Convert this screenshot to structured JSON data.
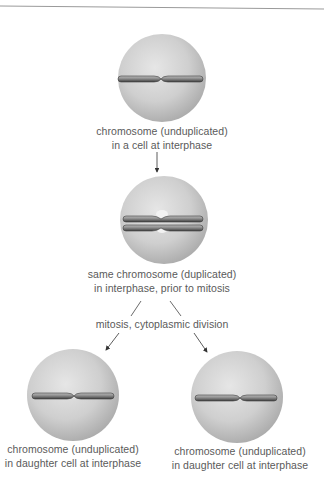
{
  "cells": [
    {
      "id": "cell-interphase",
      "chromosome": "unduplicated",
      "label_lines": [
        "chromosome (unduplicated)",
        "in a cell at interphase"
      ]
    },
    {
      "id": "cell-duplicated",
      "chromosome": "duplicated",
      "label_lines": [
        "same chromosome (duplicated)",
        "in interphase, prior to mitosis"
      ]
    },
    {
      "id": "cell-daughter-left",
      "chromosome": "unduplicated",
      "label_lines": [
        "chromosome (unduplicated)",
        "in daughter cell at interphase"
      ]
    },
    {
      "id": "cell-daughter-right",
      "chromosome": "unduplicated",
      "label_lines": [
        "chromosome (unduplicated)",
        "in daughter cell at interphase"
      ]
    }
  ],
  "process_label": "mitosis, cytoplasmic division",
  "colors": {
    "cell_light": "#e4e4e4",
    "cell_dark": "#a9a9a9",
    "chromosome": "#8a8a8a",
    "chromosome_edge": "#3c3c3c",
    "arrow": "#333333",
    "text": "#5a5a5a"
  }
}
